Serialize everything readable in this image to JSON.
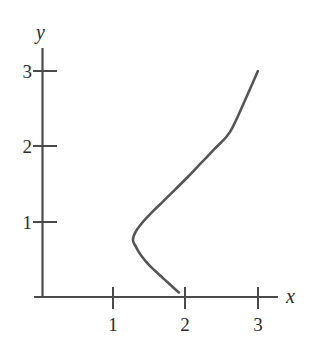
{
  "figure": {
    "background_color": "#ffffff",
    "axis_color": "#4a4a4a",
    "curve_color": "#555555",
    "text_color": "#2b2b2b"
  },
  "chart_data": {
    "type": "line",
    "title": "",
    "subtitle": "",
    "xlabel": "x",
    "ylabel": "y",
    "xlim": [
      -0.15,
      3.6
    ],
    "ylim": [
      -0.25,
      3.5
    ],
    "grid": false,
    "legend": null,
    "legend_position": "none",
    "x_ticks": [
      1,
      2,
      3
    ],
    "x_tick_labels": [
      "1",
      "2",
      "3"
    ],
    "y_ticks": [
      1,
      2,
      3
    ],
    "y_tick_labels": [
      "1",
      "2",
      "3"
    ],
    "annotations": [],
    "series": [
      {
        "name": "parametric curve",
        "description": "Curve with a smooth leftward turning point near (1.26, 0.76); lower branch descends to the x-axis near x = 1.9, upper branch rises nearly straight to (3, 3).",
        "x": [
          1.9,
          1.84,
          1.76,
          1.68,
          1.6,
          1.52,
          1.45,
          1.39,
          1.34,
          1.3,
          1.27,
          1.26,
          1.27,
          1.3,
          1.35,
          1.43,
          1.54,
          1.68,
          1.84,
          2.02,
          2.21,
          2.41,
          2.61,
          2.81,
          3.0
        ],
        "y": [
          0.06,
          0.11,
          0.18,
          0.25,
          0.32,
          0.39,
          0.46,
          0.53,
          0.6,
          0.67,
          0.72,
          0.76,
          0.81,
          0.87,
          0.94,
          1.03,
          1.14,
          1.27,
          1.42,
          1.59,
          1.78,
          1.98,
          2.19,
          2.59,
          3.0
        ]
      }
    ]
  },
  "axes": {
    "x_axis_name": "x",
    "y_axis_name": "y"
  }
}
